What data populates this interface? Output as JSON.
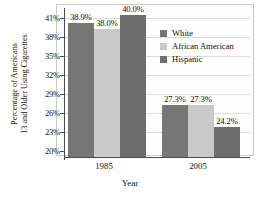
{
  "chart_data": {
    "type": "bar",
    "title": "",
    "xlabel": "Year",
    "ylabel": "Percentage of Americans 13 and Older Using Cigarettes",
    "ylabel_lines": [
      "Percentage of Americans",
      "13 and Older Using Cigarettes"
    ],
    "categories": [
      "1985",
      "2005"
    ],
    "ylim": [
      20,
      41
    ],
    "yticks": [
      "20%",
      "23%",
      "26%",
      "29%",
      "32%",
      "35%",
      "38%",
      "41%"
    ],
    "ytick_values": [
      20,
      23,
      26,
      29,
      32,
      35,
      38,
      41
    ],
    "grid": true,
    "legend_position": "right",
    "series": [
      {
        "name": "White",
        "color": "#767676",
        "values": [
          38.9,
          27.3
        ],
        "labels": [
          "38.9%",
          "27.3%"
        ]
      },
      {
        "name": "African American",
        "color": "#c9c9c9",
        "values": [
          38.0,
          27.3
        ],
        "labels": [
          "38.0%",
          "27.3%"
        ]
      },
      {
        "name": "Hispanic",
        "color": "#6e6e6e",
        "values": [
          40.0,
          24.2
        ],
        "labels": [
          "40.0%",
          "24.2%"
        ]
      }
    ]
  },
  "axis": {
    "y_title_line1": "Percentage of Americans",
    "y_title_line2": "13 and Older Using Cigarettes",
    "x_title": "Year",
    "ytick_0": "20%",
    "ytick_1": "23%",
    "ytick_2": "26%",
    "ytick_3": "29%",
    "ytick_4": "32%",
    "ytick_5": "35%",
    "ytick_6": "38%",
    "ytick_7": "41%",
    "xtick_0": "1985",
    "xtick_1": "2005"
  },
  "legend": {
    "items": [
      {
        "label": "White",
        "color": "#767676"
      },
      {
        "label": "African American",
        "color": "#c9c9c9"
      },
      {
        "label": "Hispanic",
        "color": "#6e6e6e"
      }
    ]
  },
  "bars": [
    {
      "group": "1985",
      "series": "White",
      "value": 38.9,
      "label": "38.9%",
      "color": "#767676"
    },
    {
      "group": "1985",
      "series": "African American",
      "value": 38.0,
      "label": "38.0%",
      "color": "#c9c9c9"
    },
    {
      "group": "1985",
      "series": "Hispanic",
      "value": 40.0,
      "label": "40.0%",
      "color": "#6e6e6e"
    },
    {
      "group": "2005",
      "series": "White",
      "value": 27.3,
      "label": "27.3%",
      "color": "#767676"
    },
    {
      "group": "2005",
      "series": "African American",
      "value": 27.3,
      "label": "27.3%",
      "color": "#c9c9c9"
    },
    {
      "group": "2005",
      "series": "Hispanic",
      "value": 24.2,
      "label": "24.2%",
      "color": "#6e6e6e"
    }
  ]
}
